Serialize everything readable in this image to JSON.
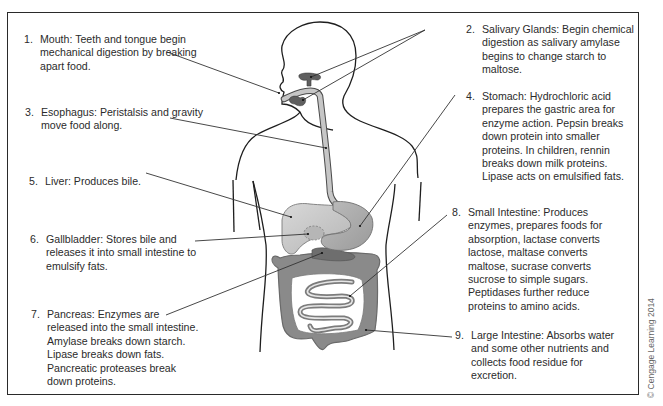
{
  "diagram": {
    "colors": {
      "border": "#2a2a2a",
      "outline": "#1e1e1e",
      "organ_light": "#c9c9c9",
      "organ_mid": "#a9a9a9",
      "organ_dark": "#7e7e7e",
      "leader_line": "#333333"
    },
    "labels": [
      {
        "num": "1.",
        "name": "Mouth",
        "text": "Mouth: Teeth and tongue begin mechanical digestion by breaking apart food."
      },
      {
        "num": "2.",
        "name": "Salivary Glands",
        "text": "Salivary Glands: Begin chemical digestion as salivary amylase begins to change starch to maltose."
      },
      {
        "num": "3.",
        "name": "Esophagus",
        "text": "Esophagus: Peristalsis and gravity move food along."
      },
      {
        "num": "4.",
        "name": "Stomach",
        "text": "Stomach: Hydrochloric acid prepares the gastric area for enzyme action. Pepsin breaks down protein into smaller proteins. In children, rennin breaks down milk proteins. Lipase acts on emulsified fats."
      },
      {
        "num": "5.",
        "name": "Liver",
        "text": "Liver: Produces bile."
      },
      {
        "num": "6.",
        "name": "Gallbladder",
        "text": "Gallbladder: Stores bile and releases it into small intestine to emulsify fats."
      },
      {
        "num": "7.",
        "name": "Pancreas",
        "text": "Pancreas: Enzymes are released into the small intestine. Amylase breaks down starch. Lipase breaks down fats. Pancreatic proteases break down proteins."
      },
      {
        "num": "8.",
        "name": "Small Intestine",
        "text": "Small Intestine: Produces enzymes, prepares foods for absorption, lactase converts lactose, maltase converts maltose, sucrase converts sucrose to simple sugars. Peptidases further reduce proteins to amino acids."
      },
      {
        "num": "9.",
        "name": "Large Intestine",
        "text": "Large Intestine: Absorbs water and some other nutrients and collects food residue for excretion."
      }
    ],
    "credit": "© Cengage Learning 2014"
  }
}
